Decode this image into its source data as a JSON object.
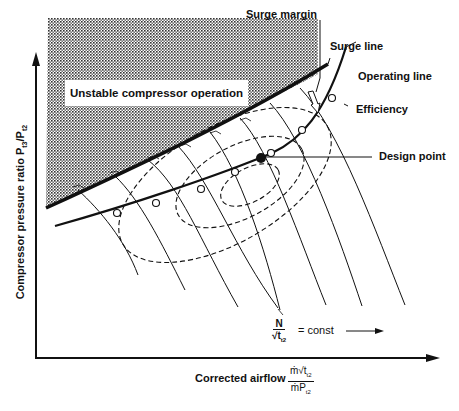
{
  "diagram": {
    "labels": {
      "surge_margin": "Surge margin",
      "surge_line": "Surge line",
      "operating_line": "Operating line",
      "efficiency": "Efficiency",
      "design_point": "Design point",
      "unstable_region": "Unstable compressor operation",
      "speed_line_num": "N",
      "speed_line_den_root": "√",
      "speed_line_den_var": "t",
      "speed_line_den_sub": "t2",
      "speed_line_eq": "= const"
    },
    "axes": {
      "y_label_main": "Compressor pressure ratio P",
      "y_label_sub1": "t3",
      "y_label_sep": "/P",
      "y_label_sub2": "t2",
      "x_label": "Corrected airflow",
      "x_frac_num": "ṁ√t",
      "x_frac_num_sub": "t2",
      "x_frac_den": "ṁP",
      "x_frac_den_sub": "t2"
    },
    "colors": {
      "ink": "#111111",
      "background": "#ffffff",
      "stipple": "#333333"
    },
    "elements": {
      "speed_lines_count": 9,
      "operating_points_count": 7,
      "efficiency_islands_count": 3
    }
  }
}
